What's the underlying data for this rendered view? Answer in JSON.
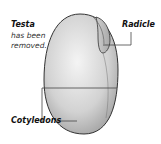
{
  "diagram": {
    "labels": {
      "testa_title": "Testa",
      "testa_note_line1": "has been",
      "testa_note_line2": "removed.",
      "radicle": "Radicle",
      "cotyledons": "Cotyledons"
    },
    "colors": {
      "seed_light": "#f2f2f2",
      "seed_dark": "#9a9a9a",
      "outline": "#333333",
      "leader": "#444444"
    }
  }
}
